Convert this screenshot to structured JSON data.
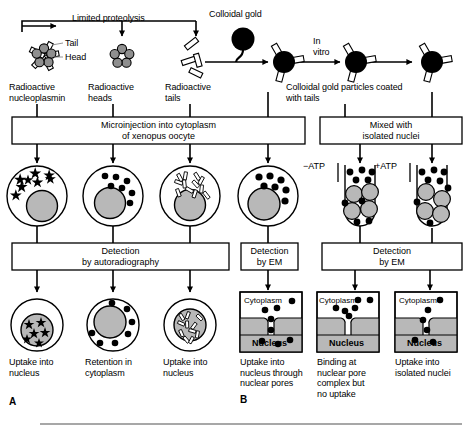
{
  "figure": {
    "panel_a_marker": "A",
    "panel_b_marker": "B"
  },
  "top_row": {
    "limited_proteolysis": "Limited proteolysis",
    "colloidal_gold": "Colloidal gold",
    "in_vitro": "In\nvitro",
    "tail_callout": "Tail",
    "head_callout": "Head"
  },
  "molecule_labels": [
    {
      "text": "Radioactive\nnucleoplasmin"
    },
    {
      "text": "Radioactive\nheads"
    },
    {
      "text": "Radioactive\ntails"
    },
    {
      "text": "Colloidal gold particles coated\nwith tails"
    }
  ],
  "process_boxes": [
    {
      "text": "Microinjection into cytoplasm\nof xenopus oocyte"
    },
    {
      "text": "Mixed with\nisolated nuclei"
    }
  ],
  "atp_labels": {
    "minus": "−ATP",
    "plus": "+ATP"
  },
  "detection_boxes": [
    {
      "text": "Detection\nby autoradiography"
    },
    {
      "text": "Detection\nby EM"
    },
    {
      "text": "Detection\nby EM"
    }
  ],
  "result_labels_a": [
    {
      "text": "Uptake into\nnucleus"
    },
    {
      "text": "Retention in\ncytoplasm"
    },
    {
      "text": "Uptake into\nnucleus"
    }
  ],
  "em_panels": [
    {
      "cytoplasm": "Cytoplasm",
      "nucleus": "Nucleus",
      "caption": "Uptake into\nnucleus through\nnuclear pores"
    },
    {
      "cytoplasm": "Cytoplasm",
      "nucleus": "Nucleus",
      "caption": "Binding at\nnuclear pore\ncomplex but\nno uptake"
    },
    {
      "cytoplasm": "Cytoplasm",
      "nucleus": "Nucleus",
      "caption": "Uptake into\nisolated nuclei"
    }
  ],
  "colors": {
    "line": "#000000",
    "nucleus_fill": "#b8b8b8",
    "head_fill": "#8f8f8f",
    "gold_fill": "#000000",
    "tail_fill": "#ffffff",
    "background": "#ffffff"
  }
}
